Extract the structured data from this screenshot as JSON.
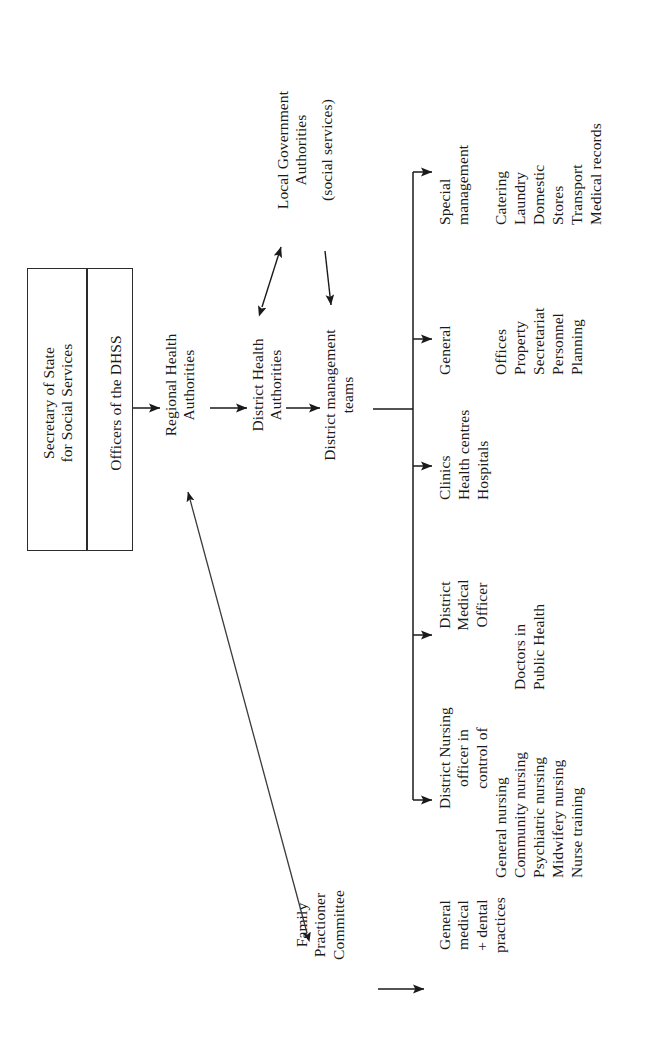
{
  "diagram": {
    "orientation": "rotated-90-ccw",
    "ink_color": "#1a1a1a",
    "background_color": "#ffffff"
  },
  "nodes": {
    "secretary_of_state": "Secretary of State\nfor Social Services",
    "dhss_officers": "Officers of the DHSS",
    "regional_health_authorities": "Regional Health\nAuthorities",
    "district_health_authorities": "District Health\nAuthorities",
    "district_management_teams": "District management\nteams",
    "local_government_authorities": "Local Government\nAuthorities",
    "local_government_qualifier": "(social services)",
    "family_practitioner_committee": "Family\nPractioner\nCommittee",
    "general_practices": "General\nmedical\n+ dental\npractices"
  },
  "branches": [
    {
      "id": "district-nursing",
      "heading": "District Nursing\nofficer in\ncontrol of",
      "items": [
        "General nursing",
        "Community nursing",
        "Psychiatric nursing",
        "Midwifery nursing",
        "Nurse training"
      ]
    },
    {
      "id": "district-medical-officer",
      "heading": "District\nMedical\nOfficer",
      "items": [
        "Doctors in",
        "Public Health"
      ]
    },
    {
      "id": "clinics",
      "heading": "Clinics",
      "items": [
        "Health centres",
        "Hospitals"
      ]
    },
    {
      "id": "general",
      "heading": "General",
      "items": [
        "Offices",
        "Property",
        "Secretariat",
        "Personnel",
        "Planning"
      ]
    },
    {
      "id": "special-management",
      "heading": "Special\nmanagement",
      "items": [
        "Catering",
        "Laundry",
        "Domestic",
        "Stores",
        "Transport",
        "Medical records"
      ]
    }
  ],
  "connectors": [
    {
      "id": "dhss-to-rha",
      "kind": "arrow",
      "from": "dhss_officers",
      "to": "regional_health_authorities"
    },
    {
      "id": "rha-to-dha",
      "kind": "arrow",
      "from": "regional_health_authorities",
      "to": "district_health_authorities"
    },
    {
      "id": "dha-to-dmt",
      "kind": "arrow",
      "from": "district_health_authorities",
      "to": "district_management_teams"
    },
    {
      "id": "dha-lga-double",
      "kind": "double-arrow",
      "from": "district_health_authorities",
      "to": "local_government_authorities"
    },
    {
      "id": "lga-to-dmt",
      "kind": "arrow",
      "from": "local_government_authorities",
      "to": "district_management_teams"
    },
    {
      "id": "dmt-trunk",
      "kind": "bus",
      "from": "district_management_teams",
      "to": "branches"
    },
    {
      "id": "fpc-rha-double",
      "kind": "double-arrow",
      "from": "family_practitioner_committee",
      "to": "regional_health_authorities"
    },
    {
      "id": "fpc-to-practices",
      "kind": "arrow",
      "from": "family_practitioner_committee",
      "to": "general_practices"
    }
  ]
}
